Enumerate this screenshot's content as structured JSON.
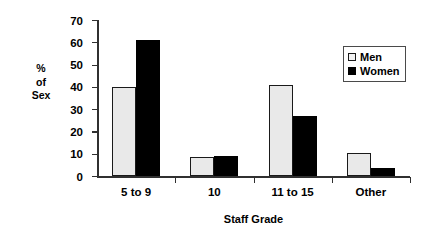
{
  "chart_data": {
    "type": "bar",
    "title": "",
    "xlabel": "Staff Grade",
    "ylabel": "% of Sex",
    "ylabel_lines": [
      "%",
      "of",
      "Sex"
    ],
    "categories": [
      "5 to 9",
      "10",
      "11 to 15",
      "Other"
    ],
    "series": [
      {
        "name": "Men",
        "values": [
          40,
          8.5,
          41,
          10.5
        ],
        "color": "#e9e9e9"
      },
      {
        "name": "Women",
        "values": [
          61,
          9,
          27,
          3.5
        ],
        "color": "#000000"
      }
    ],
    "ylim": [
      0,
      70
    ],
    "yticks": [
      0,
      10,
      20,
      30,
      40,
      50,
      60,
      70
    ],
    "ytick_labels": [
      "0",
      "10",
      "20",
      "30",
      "40",
      "50",
      "60",
      "70"
    ],
    "grid": false,
    "legend_position": "upper right"
  },
  "legend": {
    "entries": [
      {
        "label": "Men"
      },
      {
        "label": "Women"
      }
    ]
  }
}
